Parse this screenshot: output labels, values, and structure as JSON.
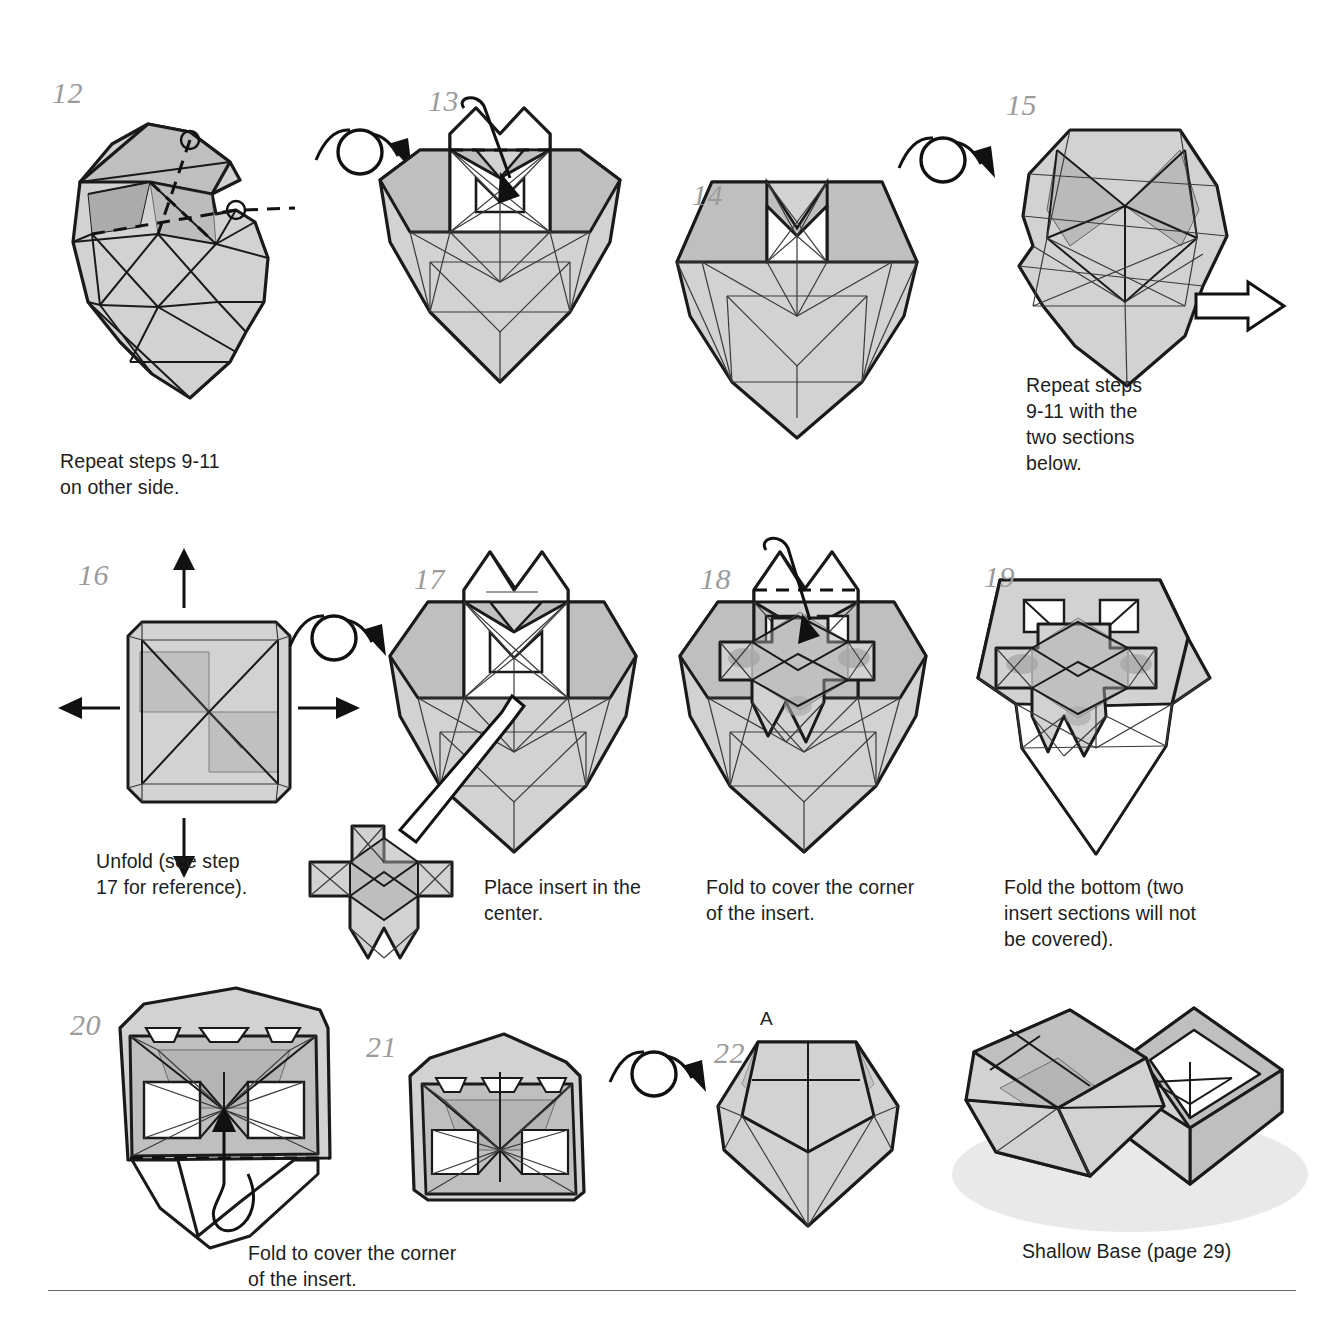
{
  "page": {
    "type": "origami-instructions",
    "footer_rule": true,
    "background": "#ffffff",
    "line_color": "#1a1a1a",
    "paper_fill": "#d2d2d2",
    "paper_fill_dark": "#bfbfbf",
    "step_number_color": "#9b9b9b",
    "caption_color": "#1d1d1d"
  },
  "steps": [
    {
      "number": "12",
      "caption": "Repeat steps 9-11\non other side.",
      "has_turnover_arrow": true
    },
    {
      "number": "13",
      "caption": "",
      "has_turnover_arrow": false
    },
    {
      "number": "14",
      "caption": "",
      "has_turnover_arrow": true
    },
    {
      "number": "15",
      "caption": "Repeat steps\n9-11 with the\ntwo sections\nbelow.",
      "has_proceed_arrow": true
    },
    {
      "number": "16",
      "caption": "Unfold (see step\n17 for reference).",
      "has_turnover_arrow": true
    },
    {
      "number": "17",
      "caption": "Place insert in the\ncenter.",
      "has_insert_piece": true
    },
    {
      "number": "18",
      "caption": "Fold to cover the corner\nof the insert."
    },
    {
      "number": "19",
      "caption": "Fold the bottom (two\ninsert sections will not\nbe covered)."
    },
    {
      "number": "20",
      "caption": "Fold to cover the corner\nof the insert."
    },
    {
      "number": "21",
      "caption": "",
      "has_turnover_arrow": true
    },
    {
      "number": "22",
      "caption": "",
      "point_label": "A"
    }
  ],
  "result": {
    "caption": "Shallow Base (page 29)"
  },
  "icons": {
    "turnover": "turn-over-arrow-icon",
    "proceed": "hollow-right-arrow-icon",
    "unfold_up": "up-arrow-icon",
    "unfold_down": "down-arrow-icon",
    "unfold_left": "left-arrow-icon",
    "unfold_right": "right-arrow-icon",
    "push_in": "push-in-arrow-icon",
    "valley_fold": "dashed-fold-line-icon"
  }
}
